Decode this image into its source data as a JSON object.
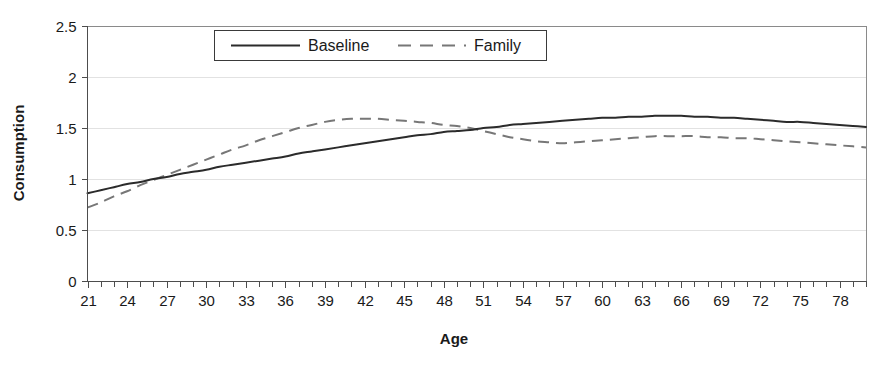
{
  "chart_data": {
    "type": "line",
    "title": "",
    "xlabel": "Age",
    "ylabel": "Consumption",
    "xlim": [
      21,
      80
    ],
    "ylim": [
      0,
      2.5
    ],
    "ytick_labels": [
      "0",
      "0.5",
      "1",
      "1.5",
      "2",
      "2.5"
    ],
    "ytick_values": [
      0,
      0.5,
      1,
      1.5,
      2,
      2.5
    ],
    "xtick_labels": [
      "21",
      "24",
      "27",
      "30",
      "33",
      "36",
      "39",
      "42",
      "45",
      "48",
      "51",
      "54",
      "57",
      "60",
      "63",
      "66",
      "69",
      "72",
      "75",
      "78"
    ],
    "xtick_values": [
      21,
      24,
      27,
      30,
      33,
      36,
      39,
      42,
      45,
      48,
      51,
      54,
      57,
      60,
      63,
      66,
      69,
      72,
      75,
      78
    ],
    "minor_tick_step": 1,
    "grid": "horizontal",
    "legend_position": "top-center",
    "x": [
      21,
      22,
      23,
      24,
      25,
      26,
      27,
      28,
      29,
      30,
      31,
      32,
      33,
      34,
      35,
      36,
      37,
      38,
      39,
      40,
      41,
      42,
      43,
      44,
      45,
      46,
      47,
      48,
      49,
      50,
      51,
      52,
      53,
      54,
      55,
      56,
      57,
      58,
      59,
      60,
      61,
      62,
      63,
      64,
      65,
      66,
      67,
      68,
      69,
      70,
      71,
      72,
      73,
      74,
      75,
      76,
      77,
      78,
      79,
      80
    ],
    "series": [
      {
        "name": "Baseline",
        "style": "solid",
        "color": "#2b2b2b",
        "values": [
          0.86,
          0.89,
          0.92,
          0.95,
          0.97,
          1.0,
          1.02,
          1.05,
          1.07,
          1.09,
          1.12,
          1.14,
          1.16,
          1.18,
          1.2,
          1.22,
          1.25,
          1.27,
          1.29,
          1.31,
          1.33,
          1.35,
          1.37,
          1.39,
          1.41,
          1.43,
          1.44,
          1.46,
          1.47,
          1.48,
          1.5,
          1.51,
          1.53,
          1.54,
          1.55,
          1.56,
          1.57,
          1.58,
          1.59,
          1.6,
          1.6,
          1.61,
          1.61,
          1.62,
          1.62,
          1.62,
          1.61,
          1.61,
          1.6,
          1.6,
          1.59,
          1.58,
          1.57,
          1.56,
          1.56,
          1.55,
          1.54,
          1.53,
          1.52,
          1.51
        ]
      },
      {
        "name": "Family",
        "style": "dashed",
        "color": "#777777",
        "values": [
          0.72,
          0.77,
          0.83,
          0.88,
          0.94,
          0.99,
          1.04,
          1.09,
          1.14,
          1.19,
          1.24,
          1.29,
          1.33,
          1.38,
          1.42,
          1.46,
          1.5,
          1.53,
          1.56,
          1.58,
          1.59,
          1.59,
          1.59,
          1.58,
          1.57,
          1.56,
          1.55,
          1.53,
          1.52,
          1.5,
          1.47,
          1.44,
          1.41,
          1.39,
          1.37,
          1.36,
          1.35,
          1.36,
          1.37,
          1.38,
          1.39,
          1.4,
          1.41,
          1.42,
          1.42,
          1.42,
          1.42,
          1.41,
          1.41,
          1.4,
          1.4,
          1.39,
          1.38,
          1.37,
          1.36,
          1.35,
          1.34,
          1.33,
          1.32,
          1.31
        ]
      }
    ],
    "annotations": []
  },
  "legend": {
    "entries": [
      {
        "label": "Baseline",
        "style": "solid"
      },
      {
        "label": "Family",
        "style": "dashed"
      }
    ]
  }
}
